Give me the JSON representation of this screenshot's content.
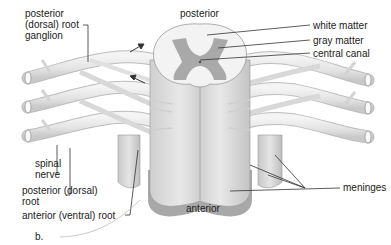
{
  "diagram": {
    "type": "anatomical-illustration",
    "panel_label": "b.",
    "orientation": {
      "top": "posterior",
      "bottom": "anterior"
    },
    "labels": {
      "ganglion_line1": "posterior",
      "ganglion_line2": "(dorsal) root",
      "ganglion_line3": "ganglion",
      "white_matter": "white matter",
      "gray_matter": "gray matter",
      "central_canal": "central canal",
      "spinal_nerve_line1": "spinal",
      "spinal_nerve_line2": "nerve",
      "posterior_root_line1": "posterior (dorsal)",
      "posterior_root_line2": "root",
      "anterior_root": "anterior (ventral) root",
      "meninges": "meninges"
    },
    "colors": {
      "nerve_fill": "#e6e6e6",
      "nerve_shade": "#c8c8c8",
      "white_matter": "#f2f2f2",
      "gray_matter": "#a9a9a9",
      "cord_body": "#d9d9d9",
      "meninges": "#bdbdbd",
      "label_text": "#222222",
      "leader_line": "#333333"
    }
  }
}
